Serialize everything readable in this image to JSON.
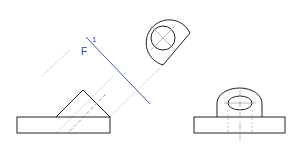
{
  "diagram": {
    "type": "orthographic-projection-with-auxiliary-view",
    "fold_line_label": "F",
    "fold_line_subscript": "1",
    "colors": {
      "object_line": "#222222",
      "fold_line": "#3a5a8a",
      "label": "#2a4a7a",
      "projection_line": "#c8ccd4",
      "center_line": "#888888"
    },
    "views": [
      {
        "name": "front-view",
        "description": "rectangular base with triangular prism on top"
      },
      {
        "name": "side-view",
        "description": "base with rounded upright and hole"
      },
      {
        "name": "auxiliary-view",
        "description": "rotated view showing circular hole in rounded boss"
      }
    ]
  }
}
